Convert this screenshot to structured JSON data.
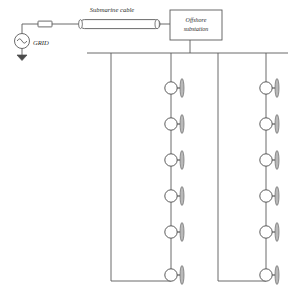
{
  "diagram": {
    "colors": {
      "line": "#5a5a5a",
      "line_dark": "#3c3c3c",
      "text": "#2b2b2b",
      "fill": "#ffffff",
      "blade_fill": "#b9b9b9",
      "background": "#ffffff"
    },
    "labels": {
      "grid": "GRID",
      "submarine_cable": "Submarine cable",
      "offshore_substation_line1": "Offshore",
      "offshore_substation_line2": "substation"
    },
    "icons": {
      "ac_source": "ac-source-icon",
      "ground": "ground-icon",
      "transformer_block": "series-element-icon",
      "cable": "submarine-cable-icon",
      "substation": "offshore-substation-box",
      "turbine": "wind-turbine-icon"
    },
    "onshore": {
      "source_center_x": 22,
      "source_center_y": 41,
      "source_radius": 7.5,
      "ground_y": 57,
      "riser_top_y": 24,
      "series_block": {
        "x": 38,
        "y": 21,
        "width": 14,
        "height": 5.5
      },
      "lead_to_cable_x": 80
    },
    "cable": {
      "x1": 80,
      "x2": 160,
      "y": 24,
      "height": 9,
      "label_x": 112,
      "label_y": 10
    },
    "substation": {
      "x": 170,
      "y": 10,
      "width": 52,
      "height": 30,
      "label_x": 196,
      "label_y1": 21,
      "label_y2": 29,
      "inlet_x": 160,
      "downlead_x": 190,
      "downlead_y2": 53
    },
    "busbar": {
      "x1": 87,
      "x2": 288,
      "y": 53,
      "feeder_x": [
        111,
        171,
        218,
        266
      ],
      "bottom_y": 281
    },
    "strings": [
      {
        "name": "string-left",
        "return_x": 111,
        "turbine_x": 171,
        "bottom_y": 281,
        "turbines": [
          {
            "cy": 88
          },
          {
            "cy": 124
          },
          {
            "cy": 160
          },
          {
            "cy": 196
          },
          {
            "cy": 232
          },
          {
            "cy": 275
          }
        ]
      },
      {
        "name": "string-right",
        "return_x": 218,
        "turbine_x": 266,
        "bottom_y": 281,
        "turbines": [
          {
            "cy": 88
          },
          {
            "cy": 124
          },
          {
            "cy": 160
          },
          {
            "cy": 196
          },
          {
            "cy": 232
          },
          {
            "cy": 275
          }
        ]
      }
    ],
    "turbine_geometry": {
      "radius": 6.2,
      "blade_offset_x": 11,
      "blade_rx": 2.0,
      "blade_ry": 9.5,
      "hub_len": 5
    },
    "counts": {
      "strings": 2,
      "turbines_per_string": 6,
      "turbines_total": 12,
      "busbar_feeders": 4
    }
  }
}
